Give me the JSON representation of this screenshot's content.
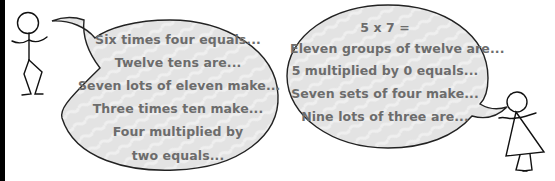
{
  "colors": {
    "bubble_fill": "#e3e3e3",
    "bubble_outline": "#222222",
    "text": "#6c6c6c",
    "edge_bar": "#000000"
  },
  "left_speaker": {
    "figure": "stick-figure-boy",
    "bubble": {
      "lines": [
        "Six times four equals...",
        "Twelve tens are...",
        "Seven lots of eleven make...",
        "Three times ten make...",
        "Four multiplied by",
        "two equals..."
      ]
    }
  },
  "right_speaker": {
    "figure": "stick-figure-girl",
    "bubble": {
      "lines": [
        "5 x 7 =",
        "Eleven groups of twelve are...",
        "5 multiplied by 0 equals...",
        "Seven sets of four make...",
        "Nine lots of three are..."
      ]
    }
  }
}
